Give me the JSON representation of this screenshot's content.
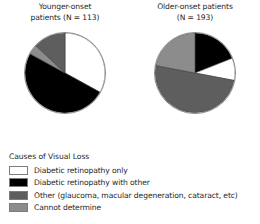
{
  "figure": {
    "legend_title": "Causes of Visual Loss"
  },
  "legend": {
    "items": [
      {
        "label": "Diabetic retinopathy only",
        "key": "dr_only",
        "color": "#ffffff"
      },
      {
        "label": "Diabetic retinopathy with other",
        "key": "dr_with_other",
        "color": "#000000"
      },
      {
        "label": "Other (glaucoma, macular degeneration, cataract, etc)",
        "key": "other",
        "color": "#5e5e5e"
      },
      {
        "label": "Cannot determine",
        "key": "cannot",
        "color": "#8c8c8c"
      }
    ]
  },
  "chart_data": [
    {
      "type": "pie",
      "title": "Younger-onset patients (N = 113)",
      "title_line1": "Younger-onset",
      "title_line2": "patients (N = 113)",
      "n": 113,
      "labels": [
        "Diabetic retinopathy only",
        "Diabetic retinopathy with other",
        "Cannot determine",
        "Other (glaucoma, macular degeneration, cataract, etc)"
      ],
      "values": [
        33,
        50,
        4,
        13
      ],
      "colors": [
        "#ffffff",
        "#000000",
        "#8c8c8c",
        "#5e5e5e"
      ],
      "start_angle_deg": 0,
      "direction": "clockwise",
      "units": "percent"
    },
    {
      "type": "pie",
      "title": "Older-onset patients (N = 193)",
      "title_line1": "Older-onset patients",
      "title_line2": "(N = 193)",
      "n": 193,
      "labels": [
        "Diabetic retinopathy with other",
        "Diabetic retinopathy only",
        "Other (glaucoma, macular degeneration, cataract, etc)",
        "Cannot determine"
      ],
      "values": [
        19,
        9,
        50,
        22
      ],
      "colors": [
        "#000000",
        "#ffffff",
        "#5e5e5e",
        "#8c8c8c"
      ],
      "start_angle_deg": 0,
      "direction": "clockwise",
      "units": "percent"
    }
  ]
}
